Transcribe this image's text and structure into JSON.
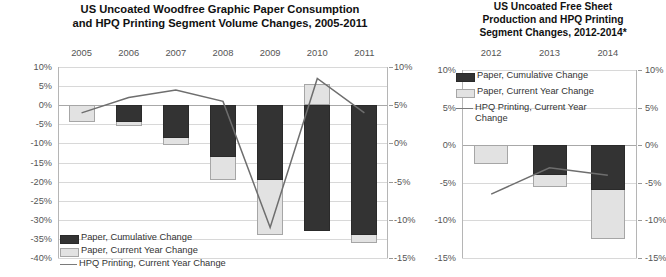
{
  "left": {
    "title": "US Uncoated Woodfree Graphic Paper Consumption and HPQ Printing Segment Volume Changes, 2005-2011",
    "title_line1": "US Uncoated Woodfree Graphic Paper Consumption",
    "title_line2": "and HPQ Printing Segment Volume Changes, 2005-2011",
    "legend": {
      "cumulative": "Paper, Cumulative Change",
      "current": "Paper, Current Year Change",
      "line": "HPQ Printing, Current Year Change"
    }
  },
  "right": {
    "title_line1": "US Uncoated Free Sheet",
    "title_line2": "Production and HPQ Printing",
    "title_line3": "Segment Changes, 2012-2014*",
    "legend": {
      "cumulative": "Paper, Cumulative Change",
      "current": "Paper, Current Year Change",
      "line": "HPQ Printing, Current Year Change"
    }
  },
  "chart_data": [
    {
      "id": "left",
      "type": "bar",
      "title": "US Uncoated Woodfree Graphic Paper Consumption and HPQ Printing Segment Volume Changes, 2005-2011",
      "xlabel": "",
      "ylabel": "",
      "categories": [
        "2005",
        "2006",
        "2007",
        "2008",
        "2009",
        "2010",
        "2011"
      ],
      "ylim": [
        -40,
        10
      ],
      "yticks": [
        "10%",
        "5%",
        "0%",
        "-5%",
        "-10%",
        "-15%",
        "-20%",
        "-25%",
        "-30%",
        "-35%",
        "-40%"
      ],
      "ytick_values": [
        10,
        5,
        0,
        -5,
        -10,
        -15,
        -20,
        -25,
        -30,
        -35,
        -40
      ],
      "y2lim": [
        -15,
        10
      ],
      "y2ticks": [
        "10%",
        "5%",
        "0%",
        "-5%",
        "-10%",
        "-15%"
      ],
      "y2tick_values": [
        10,
        5,
        0,
        -5,
        -10,
        -15
      ],
      "grid": true,
      "legend_position": "bottom-left",
      "series": [
        {
          "name": "Paper, Cumulative Change",
          "type": "bar",
          "axis": "primary",
          "values": [
            0,
            -4.5,
            -8.5,
            -13.5,
            -19.5,
            -33.0,
            -34.0
          ]
        },
        {
          "name": "Paper, Current Year Change",
          "type": "bar",
          "axis": "primary",
          "values": [
            -4.5,
            -5.5,
            -10.5,
            -19.5,
            -34.0,
            5.5,
            -36.0
          ]
        },
        {
          "name": "HPQ Printing, Current Year Change",
          "type": "line",
          "axis": "secondary",
          "values": [
            4.0,
            6.0,
            7.0,
            5.5,
            -11.0,
            8.5,
            4.0
          ]
        }
      ]
    },
    {
      "id": "right",
      "type": "bar",
      "title": "US Uncoated Free Sheet Production and HPQ Printing Segment Changes, 2012-2014*",
      "xlabel": "",
      "ylabel": "",
      "categories": [
        "2012",
        "2013",
        "2014"
      ],
      "ylim": [
        -15,
        10
      ],
      "yticks": [
        "10%",
        "5%",
        "0%",
        "-5%",
        "-10%",
        "-15%"
      ],
      "ytick_values": [
        10,
        5,
        0,
        -5,
        -10,
        -15
      ],
      "y2lim": [
        -15,
        10
      ],
      "y2ticks": [
        "10%",
        "5%",
        "0%",
        "-5%",
        "-10%",
        "-15%"
      ],
      "y2tick_values": [
        10,
        5,
        0,
        -5,
        -10,
        -15
      ],
      "grid": true,
      "legend_position": "top-left",
      "series": [
        {
          "name": "Paper, Cumulative Change",
          "type": "bar",
          "axis": "primary",
          "values": [
            0,
            -4.0,
            -6.0
          ]
        },
        {
          "name": "Paper, Current Year Change",
          "type": "bar",
          "axis": "primary",
          "values": [
            -2.5,
            -5.5,
            -12.5
          ]
        },
        {
          "name": "HPQ Printing, Current Year Change",
          "type": "line",
          "axis": "secondary",
          "values": [
            -6.5,
            -3.0,
            -4.0
          ]
        }
      ]
    }
  ]
}
